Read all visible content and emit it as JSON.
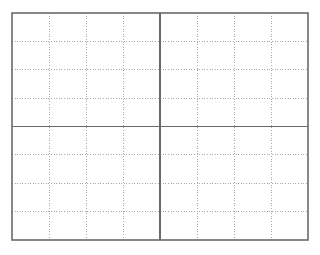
{
  "document": {
    "kind": "grid-worksheet",
    "title": "Blank Practice Grid Sheet",
    "description": "Rectangular worksheet grid divided into four quadrants by solid lines, subdivided by light dotted guide lines.",
    "page": {
      "width": 320,
      "height": 255,
      "background_color": "#fefefe"
    }
  },
  "grid": {
    "frame": {
      "x": 12,
      "y": 13,
      "width": 296,
      "height": 227,
      "stroke_color": "#6a6a6a",
      "stroke_width": 1.6
    },
    "columns_total": 8,
    "rows_total": 8,
    "cell_width": 37,
    "cell_height": 28.375,
    "major": {
      "stroke_color": "#6a6a6a",
      "stroke_width": 1.6,
      "vertical_positions": [
        160
      ],
      "horizontal_positions": [
        126.5
      ],
      "style": "solid"
    },
    "minor": {
      "stroke_color": "#a8a8a8",
      "stroke_width": 1,
      "style": "dotted",
      "dash_pattern": "1 1.6",
      "vertical_positions": [
        49,
        86,
        123,
        197,
        234,
        271
      ],
      "horizontal_positions": [
        41.4,
        69.8,
        98.1,
        154.9,
        183.2,
        211.6
      ]
    }
  },
  "colors": {
    "frame": "#6a6a6a",
    "major_line": "#6a6a6a",
    "minor_line": "#a8a8a8",
    "paper": "#fefefe"
  }
}
